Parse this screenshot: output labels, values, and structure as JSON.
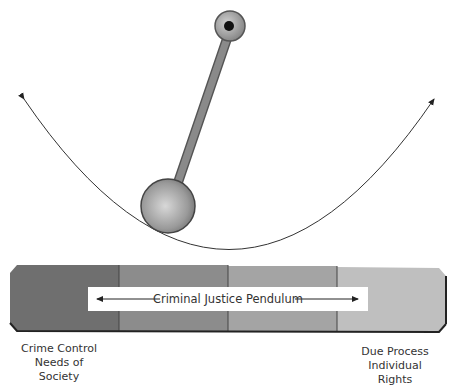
{
  "pendulum": {
    "bob_color": "#a8a8a8",
    "rod_color": "#7a7a7a"
  },
  "bar": {
    "label": "Criminal Justice Pendulum",
    "segments": [
      "#6f6f6f",
      "#8c8c8c",
      "#a4a4a4",
      "#bfbfbf"
    ]
  },
  "left_caption": {
    "line1": "Crime Control",
    "line2": "Needs of Society"
  },
  "right_caption": {
    "line1": "Due Process",
    "line2": "Individual Rights"
  }
}
